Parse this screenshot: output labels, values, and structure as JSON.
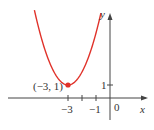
{
  "chart_data": {
    "type": "line",
    "title": "",
    "xlabel": "x",
    "ylabel": "y",
    "function": "y = (x + 3)^2 + 1",
    "series": [
      {
        "name": "parabola",
        "color": "#e0322a",
        "x": [
          -5.4,
          -5,
          -4.5,
          -4,
          -3.5,
          -3,
          -2.5,
          -2,
          -1.5,
          -1,
          -0.6
        ],
        "y": [
          6.76,
          5,
          3.25,
          2,
          1.25,
          1,
          1.25,
          2,
          3.25,
          5,
          6.76
        ]
      }
    ],
    "points": [
      {
        "x": -3,
        "y": 1,
        "label": "(−3, 1)",
        "color": "#e0322a"
      }
    ],
    "x_ticks": [
      -3,
      -2,
      -1
    ],
    "x_tick_labels": [
      "−3",
      "−1"
    ],
    "y_ticks": [
      1
    ],
    "y_tick_labels": [
      "1"
    ],
    "origin_label": "0",
    "grid": false
  },
  "labels": {
    "vertex": "(−3, 1)",
    "x_m3": "−3",
    "x_m1": "−1",
    "origin": "0",
    "y_one": "1",
    "x_axis": "x",
    "y_axis": "y"
  }
}
